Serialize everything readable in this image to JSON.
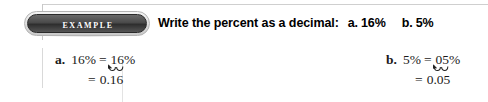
{
  "badge": {
    "label": "Example",
    "icon": "example-pill-badge"
  },
  "instruction": {
    "prompt": "Write the percent as a decimal:",
    "items": [
      {
        "tag": "a.",
        "value": "16%"
      },
      {
        "tag": "b.",
        "value": "5%"
      }
    ]
  },
  "solutions": [
    {
      "tag": "a.",
      "given": "16%",
      "equals": "=",
      "shifted": "16%",
      "result_equals": "=",
      "result": "0.16",
      "annotation": "decimal-shift-two-places-left"
    },
    {
      "tag": "b.",
      "given": "5%",
      "equals": "=",
      "shifted": "05%",
      "result_equals": "=",
      "result": "0.05",
      "annotation": "decimal-shift-two-places-left"
    }
  ],
  "colors": {
    "badge_fill": "#3a3a3a",
    "badge_ring": "#c9c9c9",
    "badge_text": "#ffffff",
    "text": "#000000",
    "rule": "#cfcfcf",
    "background": "#ffffff"
  }
}
